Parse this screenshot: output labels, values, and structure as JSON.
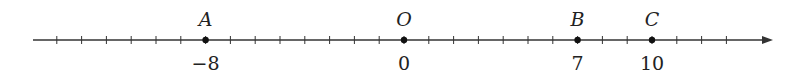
{
  "number_line": {
    "origin_px": 404,
    "unit_px": 24.8,
    "axis_y": 40,
    "line_start_px": 33,
    "line_end_px": 773,
    "tick_min": -14,
    "tick_max": 13,
    "color": "#333333",
    "points": [
      {
        "name": "A",
        "value": -8,
        "value_label": "−8"
      },
      {
        "name": "O",
        "value": 0,
        "value_label": "0"
      },
      {
        "name": "B",
        "value": 7,
        "value_label": "7"
      },
      {
        "name": "C",
        "value": 10,
        "value_label": "10"
      }
    ]
  }
}
